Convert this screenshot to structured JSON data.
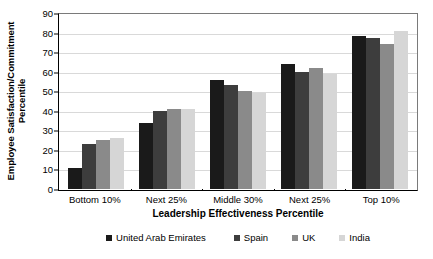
{
  "chart_data": {
    "type": "bar",
    "title": "",
    "xlabel": "Leadership Effectiveness Percentile",
    "ylabel": "Employee Satisfaction/Commitment Percentile",
    "categories": [
      "Bottom 10%",
      "Next 25%",
      "Middle 30%",
      "Next 25%",
      "Top 10%"
    ],
    "series": [
      {
        "name": "United Arab Emirates",
        "color": "#1a1a1a",
        "values": [
          11,
          34,
          56,
          64,
          78
        ]
      },
      {
        "name": "Spain",
        "color": "#3d3d3d",
        "values": [
          23,
          40,
          53,
          60,
          77
        ]
      },
      {
        "name": "UK",
        "color": "#8a8a8a",
        "values": [
          25,
          41,
          50,
          62,
          74
        ]
      },
      {
        "name": "India",
        "color": "#d6d6d6",
        "values": [
          26,
          41,
          49,
          59,
          81
        ]
      }
    ],
    "ylim": [
      0,
      90
    ],
    "yticks": [
      0,
      10,
      20,
      30,
      40,
      50,
      60,
      70,
      80,
      90
    ],
    "ytick_labels": [
      "0",
      "10",
      "20",
      "30",
      "40",
      "50",
      "60",
      "70",
      "80",
      "90"
    ],
    "grid": true,
    "legend_position": "bottom"
  },
  "axis": {
    "y_title": "Employee Satisfaction/Commitment Percentile",
    "x_title": "Leadership Effectiveness Percentile"
  }
}
